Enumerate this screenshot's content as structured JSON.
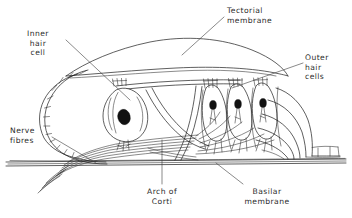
{
  "figure": {
    "kind": "anatomical-line-diagram",
    "width": 352,
    "height": 218,
    "background_color": "#ffffff",
    "ink_color": "#1b1b1b"
  },
  "labels": {
    "inner_hair_cell": {
      "text": "Inner\nhair\ncell",
      "align": "center",
      "x": 14,
      "y": 29
    },
    "tectorial_membrane": {
      "text": "Tectorial\nmembrane",
      "align": "left",
      "x": 227,
      "y": 6
    },
    "outer_hair_cells": {
      "text": "Outer\nhair\ncells",
      "align": "left",
      "x": 305,
      "y": 53
    },
    "nerve_fibres": {
      "text": "Nerve\nfibres",
      "align": "left",
      "x": 10,
      "y": 126
    },
    "arch_of_corti": {
      "text": "Arch of\nCorti",
      "align": "center",
      "x": 133,
      "y": 187
    },
    "basilar_membrane": {
      "text": "Basilar\nmembrane",
      "align": "center",
      "x": 233,
      "y": 187
    }
  },
  "structures": [
    {
      "name": "tectorial-membrane",
      "description": "Large curved flap overhanging the hair cells"
    },
    {
      "name": "inner-hair-cell",
      "description": "Single flask-shaped cell left of the arch"
    },
    {
      "name": "outer-hair-cells",
      "description": "Three columnar cells right of the arch"
    },
    {
      "name": "arch-of-corti",
      "description": "Triangular tunnel formed by pillar cells"
    },
    {
      "name": "basilar-membrane",
      "description": "Horizontal banded membrane at the base"
    },
    {
      "name": "nerve-fibres",
      "description": "Bundle of fine fibres sweeping to lower left"
    },
    {
      "name": "inner-sulcus-cells",
      "description": "Chain of cuboidal cells on the left arc"
    },
    {
      "name": "hensen-cells",
      "description": "Stacked supporting cells on the right"
    }
  ]
}
